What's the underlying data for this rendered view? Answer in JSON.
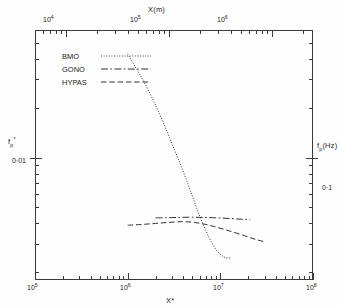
{
  "figure": {
    "top_axis_title": "X(m)",
    "bottom_axis_title": "X*",
    "left_axis_title_main": "f",
    "left_axis_title_sub": "p",
    "left_axis_title_sup": "*",
    "right_axis_title_main": "f",
    "right_axis_title_sub": "p",
    "right_axis_title_rest": "(Hz)"
  },
  "legend": {
    "items": [
      {
        "label": "BMO",
        "style": "dotted"
      },
      {
        "label": "GONO",
        "style": "dashdot"
      },
      {
        "label": "HYPAS",
        "style": "dashed"
      }
    ]
  },
  "axes": {
    "top": {
      "labels": [
        {
          "mantissa": "10",
          "exponent": "4"
        },
        {
          "mantissa": "10",
          "exponent": "5"
        },
        {
          "mantissa": "10",
          "exponent": "6"
        }
      ]
    },
    "bottom": {
      "labels": [
        {
          "mantissa": "10",
          "exponent": "5"
        },
        {
          "mantissa": "10",
          "exponent": "6"
        },
        {
          "mantissa": "10",
          "exponent": "7"
        },
        {
          "mantissa": "10",
          "exponent": "8"
        }
      ]
    },
    "left": {
      "labels": [
        {
          "text": "0·01"
        }
      ]
    },
    "right": {
      "labels": [
        {
          "text": "0·1"
        }
      ]
    }
  },
  "chart_data": {
    "type": "line",
    "title": "",
    "xlabel": "X*",
    "ylabel": "f_p*",
    "xscale": "log",
    "yscale": "log",
    "xlim": [
      100000,
      100000000
    ],
    "ylim": [
      0.0018,
      0.06
    ],
    "x2label": "X(m)",
    "x2lim": [
      5000,
      2500000
    ],
    "y2label": "f_p(Hz)",
    "y2lim": [
      0.018,
      0.6
    ],
    "grid": false,
    "legend_position": "upper-left",
    "xticks": [
      100000,
      1000000,
      10000000,
      100000000
    ],
    "xticklabels": [
      "10^5",
      "10^6",
      "10^7",
      "10^8"
    ],
    "x2ticks": [
      10000,
      100000,
      1000000
    ],
    "x2ticklabels": [
      "10^4",
      "10^5",
      "10^6"
    ],
    "yticks": [
      0.01
    ],
    "yticklabels": [
      "0·01"
    ],
    "y2ticks": [
      0.1
    ],
    "y2ticklabels": [
      "0·1"
    ],
    "series": [
      {
        "name": "BMO",
        "linestyle": "dotted",
        "color": "#333333",
        "x": [
          1000000,
          1200000,
          1500000,
          1900000,
          2400000,
          3000000,
          3800000,
          4800000,
          6000000,
          7500000,
          9000000,
          11000000,
          13000000
        ],
        "y": [
          0.043,
          0.036,
          0.029,
          0.0222,
          0.0166,
          0.0122,
          0.0088,
          0.0062,
          0.0044,
          0.0033,
          0.00275,
          0.00248,
          0.00245
        ]
      },
      {
        "name": "GONO",
        "linestyle": "dashdot",
        "color": "#333333",
        "x": [
          2000000,
          3000000,
          4500000,
          6500000,
          9500000,
          13000000,
          17000000,
          21000000
        ],
        "y": [
          0.0043,
          0.00432,
          0.00434,
          0.00433,
          0.0043,
          0.00426,
          0.00422,
          0.0042
        ]
      },
      {
        "name": "HYPAS",
        "linestyle": "dashed",
        "color": "#333333",
        "x": [
          1000000,
          1400000,
          2000000,
          2800000,
          3900000,
          5200000,
          7000000,
          9500000,
          13000000,
          18000000,
          24000000,
          30000000
        ],
        "y": [
          0.00388,
          0.00392,
          0.00398,
          0.00404,
          0.00408,
          0.00404,
          0.00392,
          0.00375,
          0.00356,
          0.00336,
          0.00318,
          0.00308
        ]
      }
    ]
  }
}
